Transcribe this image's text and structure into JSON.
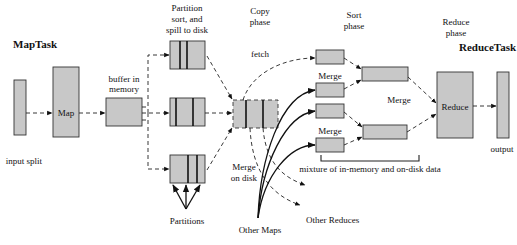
{
  "diagram": {
    "type": "Hadoop MapReduce shuffle and sort flow",
    "titles": {
      "map_task": "MapTask",
      "reduce_task": "ReduceTask"
    },
    "phases": {
      "partition_line1": "Partition",
      "partition_line2": "sort, and",
      "partition_line3": "spill to disk",
      "copy_line1": "Copy",
      "copy_line2": "phase",
      "sort_line1": "Sort",
      "sort_line2": "phase",
      "reduce_line1": "Reduce",
      "reduce_line2": "phase"
    },
    "nodes": {
      "input_split": "input split",
      "map": "Map",
      "buffer_line1": "buffer in",
      "buffer_line2": "memory",
      "partitions": "Partitions",
      "merge_on_disk_line1": "Merge",
      "merge_on_disk_line2": "on disk",
      "fetch": "fetch",
      "other_maps": "Other Maps",
      "other_reduces": "Other Reduces",
      "merge_top": "Merge",
      "merge_bottom": "Merge",
      "merge_middle": "Merge",
      "reduce": "Reduce",
      "output": "output",
      "mixture": "mixture of in-memory and on-disk data"
    },
    "colors": {
      "box_fill": "#c8c8c8",
      "stroke": "#333333",
      "background": "#ffffff"
    }
  }
}
